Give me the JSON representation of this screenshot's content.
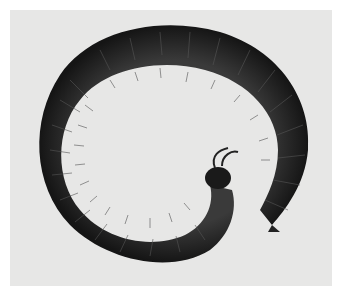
{
  "image": {
    "subject": "Coiled millipede photograph (black and white)",
    "alt": "A dark, segmented millipede curled into a spiral on a light gray background, with many fine legs visible along the inner curve and its head with antennae at the center right."
  },
  "colors": {
    "background": "#ffffff",
    "photo_background": "#e7e7e6",
    "body_dark": "#1a1a1a",
    "body_mid": "#3a3a3a",
    "legs": "#777777"
  },
  "caption": ""
}
